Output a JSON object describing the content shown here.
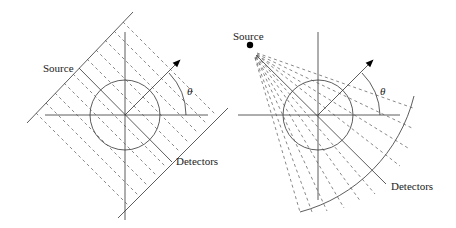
{
  "figure": {
    "parallel_beam": {
      "source_label": "Source",
      "detectors_label": "Detectors",
      "angle_label": "θ"
    },
    "fan_beam": {
      "source_label": "Source",
      "detectors_label": "Detectors",
      "angle_label": "θ"
    }
  },
  "colors": {
    "line": "#333333",
    "dashed": "#555555"
  }
}
